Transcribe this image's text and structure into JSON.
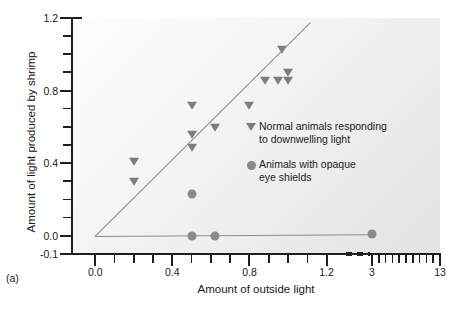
{
  "panel_label": "(a)",
  "colors": {
    "marker": "#7d7d7d",
    "dot": "#8a8a8a",
    "line": "#8c8c8c",
    "axis": "#1f1f1f",
    "plot_bg_light": "#fdfdfd",
    "plot_bg_dark": "#e2e2e2"
  },
  "legend": {
    "entries": [
      {
        "symbol": "triangle-down-icon",
        "line1": "Normal animals responding",
        "line2": "to downwelling light"
      },
      {
        "symbol": "circle-icon",
        "line1": "Animals with opaque",
        "line2": "eye shields"
      }
    ]
  },
  "chart_data": {
    "type": "scatter",
    "title": "",
    "xlabel": "Amount of outside light",
    "ylabel": "Amount of light produced by shrimp",
    "xlim": [
      -0.1,
      13
    ],
    "ylim": [
      -0.1,
      1.2
    ],
    "grid": false,
    "legend_position": "right-middle",
    "broken_axis": {
      "axis": "x",
      "from": 1.2,
      "to": 3.0
    },
    "x_ticks_major": [
      "0.0",
      "0.4",
      "0.8",
      "1.2",
      "3",
      "13"
    ],
    "x_tick_values": [
      0.0,
      0.4,
      0.8,
      1.2,
      3,
      13
    ],
    "x_ticks_minor": [
      0.1,
      0.2,
      0.3,
      0.5,
      0.6,
      0.7,
      0.9,
      1.0,
      1.1
    ],
    "y_ticks_major": [
      "1.2",
      "0.8",
      "0.4",
      "0.0",
      "-0.1"
    ],
    "y_tick_values": [
      1.2,
      0.8,
      0.4,
      0.0,
      -0.1
    ],
    "y_ticks_minor": [
      0.1,
      0.2,
      0.3,
      0.5,
      0.6,
      0.7,
      0.9,
      1.0,
      1.1
    ],
    "series": [
      {
        "name": "Normal animals responding to downwelling light",
        "marker": "triangle-down",
        "points": [
          {
            "x": 0.2,
            "y": 0.41
          },
          {
            "x": 0.2,
            "y": 0.3
          },
          {
            "x": 0.5,
            "y": 0.72
          },
          {
            "x": 0.5,
            "y": 0.56
          },
          {
            "x": 0.5,
            "y": 0.49
          },
          {
            "x": 0.62,
            "y": 0.6
          },
          {
            "x": 0.8,
            "y": 0.72
          },
          {
            "x": 0.88,
            "y": 0.86
          },
          {
            "x": 0.95,
            "y": 0.86
          },
          {
            "x": 1.0,
            "y": 0.86
          },
          {
            "x": 1.0,
            "y": 0.9
          },
          {
            "x": 0.97,
            "y": 1.03
          }
        ]
      },
      {
        "name": "Animals with opaque eye shields",
        "marker": "circle",
        "points": [
          {
            "x": 0.5,
            "y": 0.23
          },
          {
            "x": 0.5,
            "y": 0.0
          },
          {
            "x": 0.62,
            "y": 0.0
          },
          {
            "x": 2.95,
            "y": 0.01
          }
        ]
      }
    ],
    "lines": [
      {
        "name": "regression-normal",
        "x1": 0.0,
        "y1": 0.0,
        "x2": 1.12,
        "y2": 1.18
      },
      {
        "name": "baseline-shielded",
        "x1": 0.0,
        "y1": 0.0,
        "x2": 2.95,
        "y2": 0.01
      }
    ]
  }
}
